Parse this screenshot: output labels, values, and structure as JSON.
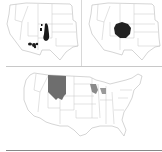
{
  "figure": {
    "panels": [
      {
        "id": "a",
        "region": "Western United States",
        "caption": "",
        "features": [
          "scattered dark occurrence spots in Arizona/New Mexico",
          "dark teardrop-shaped area in Colorado"
        ],
        "fill_color": "#1a1a1a"
      },
      {
        "id": "b",
        "region": "Western United States",
        "caption": "",
        "features": [
          "single dark blob in western Colorado / eastern Utah"
        ],
        "fill_color": "#222222"
      },
      {
        "id": "c",
        "region": "Contiguous United States",
        "caption": "",
        "features": [
          "Montana and northern Wyoming shaded gray",
          "gray patches in Wisconsin and Michigan"
        ],
        "fill_color": "#6e6e6e"
      }
    ],
    "outline_color": "#b8b8b8",
    "background": "#ffffff"
  }
}
